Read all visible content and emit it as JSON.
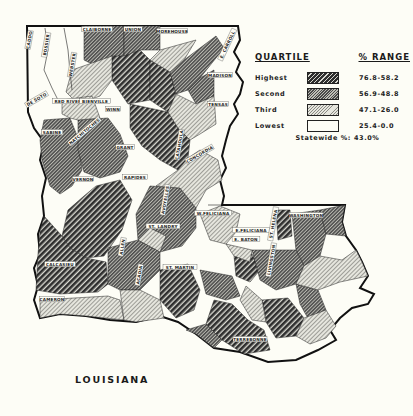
{
  "map": {
    "title": "LOUISIANA",
    "statewide_label": "Statewide %: 43.0%",
    "colors": {
      "background": "#fdfdf6",
      "outline": "#111111",
      "highest": "#3a3a3a",
      "second": "#6a6a6a",
      "third": "#c8c8c8",
      "lowest": "#fdfdf6"
    }
  },
  "legend": {
    "header_left": "QUARTILE",
    "header_right": "% RANGE",
    "items": [
      {
        "name": "Highest",
        "range": "76.8-58.2",
        "pattern": "highest"
      },
      {
        "name": "Second",
        "range": "56.9-48.8",
        "pattern": "second"
      },
      {
        "name": "Third",
        "range": "47.1-26.0",
        "pattern": "third"
      },
      {
        "name": "Lowest",
        "range": "25.4-0.0",
        "pattern": "lowest"
      }
    ],
    "statewide": "Statewide %: 43.0%"
  },
  "parish_labels": [
    {
      "name": "CADDO",
      "x": 30,
      "y": 40,
      "rot": -80
    },
    {
      "name": "BOSSIER",
      "x": 47,
      "y": 45,
      "rot": -80
    },
    {
      "name": "WEBSTER",
      "x": 73,
      "y": 65,
      "rot": -80
    },
    {
      "name": "CLAIBORNE",
      "x": 97,
      "y": 30,
      "rot": 0
    },
    {
      "name": "UNION",
      "x": 133,
      "y": 30,
      "rot": 0
    },
    {
      "name": "MOREHOUSE",
      "x": 172,
      "y": 32,
      "rot": 0
    },
    {
      "name": "E. CARROLL",
      "x": 228,
      "y": 45,
      "rot": -65
    },
    {
      "name": "MADISON",
      "x": 220,
      "y": 76,
      "rot": 0
    },
    {
      "name": "TENSAS",
      "x": 218,
      "y": 105,
      "rot": 0
    },
    {
      "name": "DE SOTO",
      "x": 37,
      "y": 100,
      "rot": -30
    },
    {
      "name": "RED RIVER",
      "x": 68,
      "y": 102,
      "rot": 0
    },
    {
      "name": "BIENVILLE",
      "x": 95,
      "y": 102,
      "rot": 0
    },
    {
      "name": "WINN",
      "x": 113,
      "y": 110,
      "rot": 0
    },
    {
      "name": "SABINE",
      "x": 52,
      "y": 133,
      "rot": 0
    },
    {
      "name": "NATCHITOCHES",
      "x": 85,
      "y": 132,
      "rot": -40
    },
    {
      "name": "GRANT",
      "x": 125,
      "y": 148,
      "rot": 0
    },
    {
      "name": "CATAHOULA",
      "x": 180,
      "y": 145,
      "rot": -80
    },
    {
      "name": "CONCORDIA",
      "x": 200,
      "y": 155,
      "rot": -30
    },
    {
      "name": "RAPIDES",
      "x": 135,
      "y": 178,
      "rot": 0
    },
    {
      "name": "VERNON",
      "x": 83,
      "y": 180,
      "rot": 0
    },
    {
      "name": "AVOYELLES",
      "x": 166,
      "y": 200,
      "rot": -80
    },
    {
      "name": "W.FELICIANA",
      "x": 213,
      "y": 214,
      "rot": 0
    },
    {
      "name": "E.FELICIANA",
      "x": 251,
      "y": 231,
      "rot": 0
    },
    {
      "name": "ST. HELENA",
      "x": 274,
      "y": 224,
      "rot": -80
    },
    {
      "name": "WASHINGTON",
      "x": 306,
      "y": 216,
      "rot": 0
    },
    {
      "name": "ST. LANDRY",
      "x": 163,
      "y": 227,
      "rot": 0
    },
    {
      "name": "E. BATON",
      "x": 246,
      "y": 240,
      "rot": 0
    },
    {
      "name": "ALLEN",
      "x": 123,
      "y": 247,
      "rot": -80
    },
    {
      "name": "ACADIA",
      "x": 140,
      "y": 275,
      "rot": -80
    },
    {
      "name": "CALCASIEU",
      "x": 60,
      "y": 265,
      "rot": 0
    },
    {
      "name": "CAMERON",
      "x": 52,
      "y": 300,
      "rot": 0
    },
    {
      "name": "ST. MARTIN",
      "x": 180,
      "y": 268,
      "rot": 0
    },
    {
      "name": "TERREBONNE",
      "x": 250,
      "y": 340,
      "rot": 0
    },
    {
      "name": "LIVINGSTON",
      "x": 272,
      "y": 260,
      "rot": -80
    }
  ]
}
